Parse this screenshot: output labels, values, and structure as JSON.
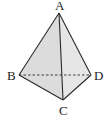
{
  "diagram": {
    "type": "tetrahedron",
    "vertices": {
      "A": {
        "label": "A"
      },
      "B": {
        "label": "B"
      },
      "C": {
        "label": "C"
      },
      "D": {
        "label": "D"
      }
    },
    "faces": [
      {
        "name": "ABC",
        "fill": "#dcdcdc"
      },
      {
        "name": "ACD",
        "fill": "#e6e6e6"
      }
    ],
    "edges": [
      {
        "from": "A",
        "to": "B",
        "style": "solid"
      },
      {
        "from": "A",
        "to": "C",
        "style": "solid"
      },
      {
        "from": "A",
        "to": "D",
        "style": "solid"
      },
      {
        "from": "B",
        "to": "C",
        "style": "solid"
      },
      {
        "from": "C",
        "to": "D",
        "style": "solid"
      },
      {
        "from": "B",
        "to": "D",
        "style": "dashed"
      }
    ],
    "colors": {
      "edge": "#2a2a2a",
      "label": "#222222",
      "background": "#ffffff"
    }
  }
}
